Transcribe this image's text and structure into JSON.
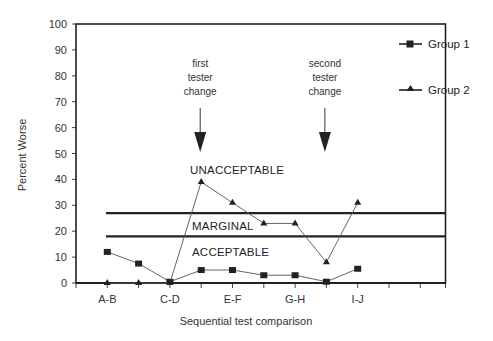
{
  "chart_data": {
    "type": "line",
    "title": "",
    "xlabel": "Sequential test comparison",
    "ylabel": "Percent Worse",
    "ylim": [
      0,
      100
    ],
    "yticks": [
      0,
      10,
      20,
      30,
      40,
      50,
      60,
      70,
      80,
      90,
      100
    ],
    "x_positions": 9,
    "x_tick_labels": [
      {
        "index": 0,
        "label": "A-B"
      },
      {
        "index": 2,
        "label": "C-D"
      },
      {
        "index": 4,
        "label": "E-F"
      },
      {
        "index": 6,
        "label": "G-H"
      },
      {
        "index": 8,
        "label": "I-J"
      }
    ],
    "series": [
      {
        "name": "Group 1",
        "marker": "square",
        "values": [
          12,
          7.5,
          0.5,
          5,
          5,
          3,
          3,
          0.5,
          5.5
        ]
      },
      {
        "name": "Group 2",
        "marker": "triangle",
        "values": [
          0,
          0,
          0,
          39,
          31,
          23,
          23,
          8,
          31
        ]
      }
    ],
    "threshold_lines": [
      {
        "y": 27,
        "label_above": "UNACCEPTABLE"
      },
      {
        "y": 18,
        "label_between": "MARGINAL"
      }
    ],
    "zones": [
      "UNACCEPTABLE",
      "MARGINAL",
      "ACCEPTABLE"
    ],
    "annotations": [
      {
        "text_lines": [
          "first",
          "tester",
          "change"
        ],
        "arrow_at_index": 3
      },
      {
        "text_lines": [
          "second",
          "tester",
          "change"
        ],
        "arrow_at_index": 7
      }
    ],
    "legend": {
      "position": "right",
      "entries": [
        "Group 1",
        "Group 2"
      ]
    },
    "grid": false
  },
  "labels": {
    "ylabel": "Percent Worse",
    "xlabel": "Sequential test comparison",
    "zone_unacceptable": "UNACCEPTABLE",
    "zone_marginal": "MARGINAL",
    "zone_acceptable": "ACCEPTABLE",
    "note1": [
      "first",
      "tester",
      "change"
    ],
    "note2": [
      "second",
      "tester",
      "change"
    ],
    "legend1": "Group 1",
    "legend2": "Group 2"
  }
}
